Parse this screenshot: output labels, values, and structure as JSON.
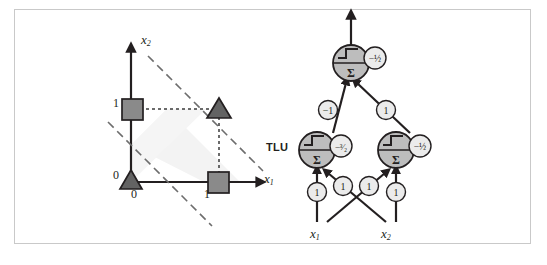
{
  "figure": {
    "caption": "",
    "border_color": "#c9c9c9",
    "background": "#ffffff"
  },
  "left_panel": {
    "name": "xor-input-space-plot",
    "axis_x_label": "x",
    "axis_x_sub": "1",
    "axis_y_label": "x",
    "axis_y_sub": "2",
    "y_tick_0": "0",
    "y_tick_1": "1",
    "x_tick_0": "0",
    "x_tick_1": "1",
    "marker_fill": "#8a8a8a",
    "marker_stroke": "#231f20",
    "axis_color": "#231f20",
    "dash_color": "#6d6d6d",
    "band_fill": "#f2f2f2",
    "points": [
      {
        "name": "point-0-0",
        "x": 0,
        "y": 0,
        "class": 0,
        "shape": "triangle"
      },
      {
        "name": "point-0-1",
        "x": 0,
        "y": 1,
        "class": 1,
        "shape": "square"
      },
      {
        "name": "point-1-0",
        "x": 1,
        "y": 0,
        "class": 1,
        "shape": "square"
      },
      {
        "name": "point-1-1",
        "x": 1,
        "y": 1,
        "class": 0,
        "shape": "triangle"
      }
    ],
    "decision_boundaries": [
      {
        "name": "boundary-lower",
        "equation": "x1 + x2 = 1/2",
        "slope": -1,
        "intercept": 0.5,
        "style": "dashed"
      },
      {
        "name": "boundary-upper",
        "equation": "x1 + x2 = 3/2",
        "slope": -1,
        "intercept": 1.5,
        "style": "dashed"
      }
    ]
  },
  "right_panel": {
    "name": "xor-mlp-network",
    "tlu_label": "TLU",
    "input_1_label": "x",
    "input_1_sub": "1",
    "input_2_label": "x",
    "input_2_sub": "2",
    "neuron_fill": "#bdbdbd",
    "weight_fill": "#ebebeb",
    "stroke": "#231f20",
    "neurons": [
      {
        "name": "neuron-output",
        "bias": "-½",
        "activation": "step",
        "sum_symbol": "Σ",
        "layer": "output"
      },
      {
        "name": "neuron-hidden-left",
        "bias": "-³⁄₂",
        "activation": "step",
        "sum_symbol": "Σ",
        "layer": "hidden"
      },
      {
        "name": "neuron-hidden-right",
        "bias": "-½",
        "activation": "step",
        "sum_symbol": "Σ",
        "layer": "hidden"
      }
    ],
    "weights": [
      {
        "name": "weight-hidden-left-to-output",
        "value": "-1"
      },
      {
        "name": "weight-hidden-right-to-output",
        "value": "1"
      },
      {
        "name": "weight-x1-to-hidden-left",
        "value": "1"
      },
      {
        "name": "weight-x2-to-hidden-left",
        "value": "1"
      },
      {
        "name": "weight-x1-to-hidden-right",
        "value": "1"
      },
      {
        "name": "weight-x2-to-hidden-right",
        "value": "1"
      }
    ]
  }
}
